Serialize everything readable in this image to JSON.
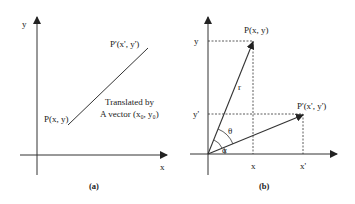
{
  "panel_a": {
    "caption": "(a)",
    "y_axis_label": "y",
    "x_axis_label": "x",
    "point_start_label": "P(x, y)",
    "point_end_label": "P'(x', y')",
    "annotation_line1": "Translated by",
    "annotation_line2": "A vector (x₀, y₀)"
  },
  "panel_b": {
    "caption": "(b)",
    "y_tick_label": "y",
    "y_prime_tick_label": "y'",
    "x_tick_label": "x",
    "x_prime_tick_label": "x'",
    "point_p_label": "P(x, y)",
    "point_p_prime_label": "P'(x', y')",
    "radius_label": "r",
    "theta_label": "θ",
    "alpha_label": "α"
  },
  "colors": {
    "line": "#333333",
    "text": "#222222"
  }
}
